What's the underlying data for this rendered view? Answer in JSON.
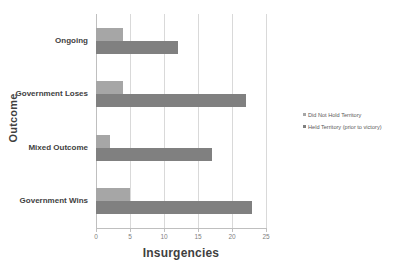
{
  "chart_data": {
    "type": "bar",
    "orientation": "horizontal",
    "title": "",
    "xlabel": "Insurgencies",
    "ylabel": "Outcome",
    "categories": [
      "Ongoing",
      "Government Loses",
      "Mixed Outcome",
      "Government Wins"
    ],
    "series": [
      {
        "name": "Did Not Hold Territory",
        "color": "#a6a6a6",
        "values": [
          4,
          4,
          2,
          5
        ]
      },
      {
        "name": "Held Territory (prior to victory)",
        "color": "#808080",
        "values": [
          12,
          22,
          17,
          23
        ]
      }
    ],
    "xlim": [
      0,
      25
    ],
    "xticks": [
      0,
      5,
      10,
      15,
      20,
      25
    ],
    "xtick_labels": [
      "0",
      "5",
      "10",
      "15",
      "20",
      "25"
    ],
    "grid": true,
    "grid_axis": "x",
    "legend_position": "right"
  },
  "axis": {
    "x_title": "Insurgencies",
    "y_title": "Outcome"
  }
}
